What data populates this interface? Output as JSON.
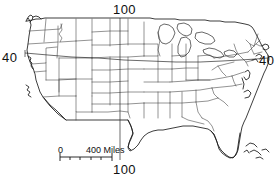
{
  "map": {
    "title": "Contiguous United States outline map",
    "projection_note": "state boundaries line map",
    "graticule": {
      "meridian": {
        "value": "100",
        "label_top": "100",
        "label_bottom": "100",
        "units": "degrees west longitude"
      },
      "parallel": {
        "value": "40",
        "label_left": "40",
        "label_right": "40",
        "units": "degrees north latitude"
      }
    },
    "scale_bar": {
      "zero_label": "0",
      "max_label": "400 Miles",
      "tick_count": 4
    },
    "colors": {
      "background": "#ffffff",
      "coastline": "#1b1b1b",
      "state_border": "#3a3a3a",
      "graticule": "#2b2b2b",
      "text": "#111111"
    }
  }
}
